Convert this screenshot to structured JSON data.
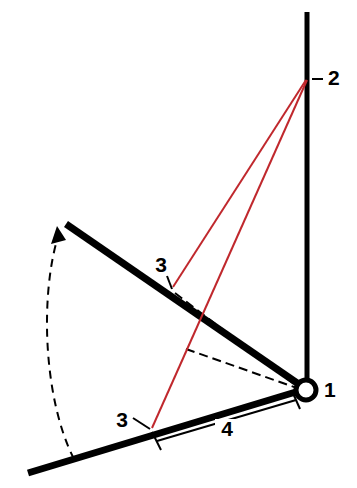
{
  "figure": {
    "type": "mechanical-linkage-diagram",
    "background_color": "#ffffff",
    "width": 357,
    "height": 488,
    "line_color": "#000000",
    "accent_color": "#c0282d",
    "dashed_color": "#000000"
  },
  "labels": {
    "pivot": "1",
    "post_top": "2",
    "attach_upper": "3",
    "attach_lower": "3",
    "dimension": "4"
  },
  "callouts": [
    {
      "id": "label-1",
      "text": "1",
      "x": 324,
      "y": 391,
      "refers_to": "pivot-joint"
    },
    {
      "id": "label-2",
      "text": "2",
      "x": 331,
      "y": 79,
      "refers_to": "post-top-anchor"
    },
    {
      "id": "label-3-upper",
      "text": "3",
      "x": 160,
      "y": 266,
      "refers_to": "arm-attachment-raised"
    },
    {
      "id": "label-3-lower",
      "text": "3",
      "x": 122,
      "y": 420,
      "refers_to": "arm-attachment-lowered"
    },
    {
      "id": "label-4",
      "text": "4",
      "x": 225,
      "y": 431,
      "refers_to": "dimension-span"
    }
  ],
  "geometry": {
    "pivot": {
      "x": 306,
      "y": 390,
      "radius": 11
    },
    "post": {
      "x1": 307,
      "y1": 12,
      "x2": 307,
      "y2": 386
    },
    "post_top_anchor": {
      "x": 306,
      "y": 80
    },
    "arm_raised": {
      "x1": 66,
      "y1": 224,
      "x2": 300,
      "y2": 384
    },
    "arm_lowered": {
      "x1": 28,
      "y1": 473,
      "x2": 297,
      "y2": 392
    },
    "attach_upper_point": {
      "x": 173,
      "y": 287
    },
    "attach_lower_point": {
      "x": 152,
      "y": 428
    },
    "red_line_upper": {
      "x1": 306,
      "y1": 80,
      "x2": 173,
      "y2": 287
    },
    "red_line_lower": {
      "x1": 306,
      "y1": 80,
      "x2": 152,
      "y2": 428
    },
    "dashed_parallel_upper": {
      "x1": 174,
      "y1": 292,
      "x2": 297,
      "y2": 386
    },
    "dashed_secondary": {
      "x1": 186,
      "y1": 349,
      "x2": 296,
      "y2": 387
    },
    "dimension_line": {
      "x1": 156,
      "y1": 440,
      "x2": 297,
      "y2": 400
    },
    "rotation_arc": {
      "start": {
        "x": 74,
        "y": 458
      },
      "end": {
        "x": 56,
        "y": 236
      },
      "arrow_at": "end",
      "direction": "counter-clockwise-upward"
    }
  }
}
